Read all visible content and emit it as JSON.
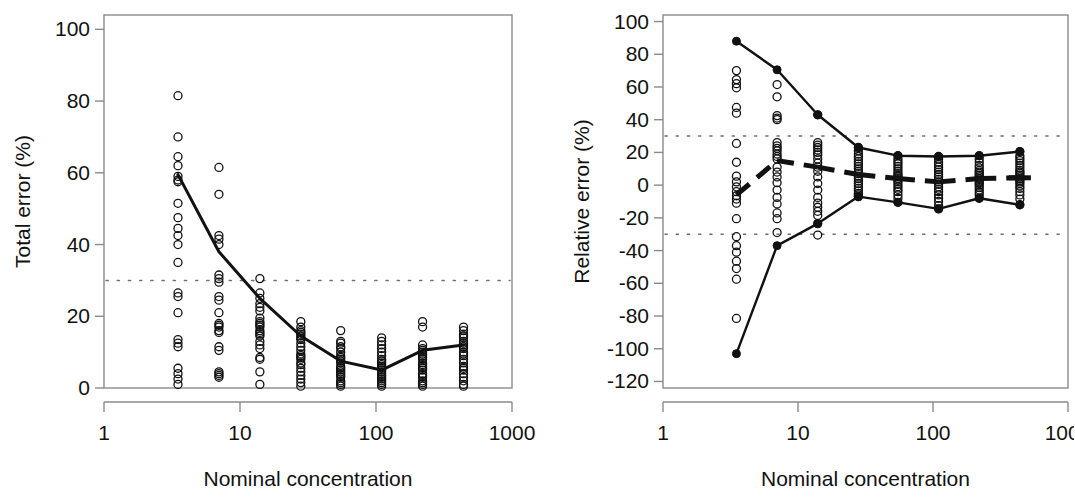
{
  "figure": {
    "background": "#ffffff",
    "ink": "#111111",
    "width": 1075,
    "height": 498
  },
  "chart_data": [
    {
      "panel": "left",
      "type": "scatter",
      "title": "",
      "xlabel": "Nominal concentration",
      "ylabel": "Total error (%)",
      "xscale": "log",
      "xlim": [
        1,
        1000
      ],
      "ylim": [
        0,
        104
      ],
      "grid": false,
      "legend": "none",
      "xtick_labels": [
        "1",
        "10",
        "100",
        "1000"
      ],
      "xtick_values": [
        1,
        10,
        100,
        1000
      ],
      "ytick_labels": [
        "0",
        "20",
        "40",
        "60",
        "80",
        "100"
      ],
      "ytick_values": [
        0,
        20,
        40,
        60,
        80,
        100
      ],
      "annotations": [
        {
          "name": "acceptance-threshold",
          "type": "hline",
          "value": 30,
          "style": "dotted",
          "label": "30"
        }
      ],
      "series": [
        {
          "name": "Median total error",
          "style": "solid-line",
          "x": [
            3.5,
            7,
            14,
            28,
            55,
            110,
            220,
            440
          ],
          "values": [
            59.5,
            38.0,
            25.0,
            14.5,
            7.5,
            5.0,
            10.5,
            12.0
          ]
        },
        {
          "name": "Total error observations",
          "style": "open-circles",
          "points": [
            {
              "x": 3.5,
              "y": [
                81.5,
                70.0,
                64.5,
                62.0,
                59.0,
                58.0,
                57.5,
                51.5,
                47.5,
                44.5,
                42.5,
                40.0,
                35.0,
                26.5,
                25.5,
                21.0,
                13.5,
                12.5,
                11.5,
                5.5,
                4.0,
                2.5,
                1.0
              ]
            },
            {
              "x": 7.0,
              "y": [
                61.5,
                54.0,
                42.5,
                41.5,
                40.0,
                31.5,
                30.5,
                29.5,
                25.5,
                24.5,
                21.0,
                18.0,
                17.5,
                17.0,
                16.0,
                15.5,
                11.5,
                10.5,
                4.5,
                4.0,
                3.5,
                3.0
              ]
            },
            {
              "x": 14.0,
              "y": [
                30.5,
                26.5,
                25.0,
                23.5,
                22.5,
                21.5,
                19.5,
                18.5,
                18.0,
                17.5,
                17.0,
                16.0,
                15.5,
                15.0,
                14.5,
                13.0,
                12.0,
                11.0,
                8.5,
                8.0,
                4.5,
                1.0
              ]
            },
            {
              "x": 28.0,
              "y": [
                18.5,
                17.0,
                16.0,
                15.5,
                15.0,
                14.5,
                14.0,
                13.5,
                12.5,
                11.5,
                10.5,
                9.5,
                9.0,
                8.5,
                8.0,
                7.0,
                6.5,
                5.5,
                4.5,
                3.5,
                2.5,
                1.5,
                0.5
              ]
            },
            {
              "x": 55.0,
              "y": [
                16.0,
                13.0,
                12.5,
                11.5,
                11.0,
                10.0,
                9.0,
                8.5,
                8.0,
                7.5,
                7.0,
                6.0,
                5.5,
                5.0,
                4.5,
                4.0,
                3.5,
                3.0,
                2.0,
                1.5,
                1.0,
                0.5
              ]
            },
            {
              "x": 110.0,
              "y": [
                14.0,
                13.0,
                12.0,
                11.0,
                10.0,
                9.0,
                8.0,
                7.5,
                7.0,
                6.5,
                6.0,
                5.5,
                5.0,
                4.5,
                4.0,
                3.5,
                3.0,
                2.5,
                2.0,
                1.5,
                1.0,
                0.5
              ]
            },
            {
              "x": 220.0,
              "y": [
                18.5,
                17.0,
                12.0,
                11.0,
                10.5,
                10.0,
                9.5,
                9.0,
                8.5,
                8.0,
                7.0,
                6.5,
                6.0,
                5.5,
                5.0,
                4.0,
                3.5,
                3.0,
                2.0,
                1.5,
                1.0,
                0.5
              ]
            },
            {
              "x": 440.0,
              "y": [
                17.0,
                16.0,
                15.0,
                14.5,
                14.0,
                13.0,
                12.5,
                12.0,
                11.5,
                11.0,
                10.0,
                9.5,
                9.0,
                8.0,
                7.0,
                6.0,
                5.5,
                5.0,
                4.0,
                3.0,
                2.0,
                1.0,
                0.5
              ]
            }
          ]
        }
      ]
    },
    {
      "panel": "right",
      "type": "scatter",
      "title": "",
      "xlabel": "Nominal concentration",
      "ylabel": "Relative error (%)",
      "xscale": "log",
      "xlim": [
        1,
        1000
      ],
      "ylim": [
        -124,
        104
      ],
      "grid": false,
      "legend": "none",
      "xtick_labels": [
        "1",
        "10",
        "100",
        "1000"
      ],
      "xtick_values": [
        1,
        10,
        100,
        1000
      ],
      "ytick_labels": [
        "-120",
        "-100",
        "-80",
        "-60",
        "-40",
        "-20",
        "0",
        "20",
        "40",
        "60",
        "80",
        "100"
      ],
      "ytick_values": [
        -120,
        -100,
        -80,
        -60,
        -40,
        -20,
        0,
        20,
        40,
        60,
        80,
        100
      ],
      "annotations": [
        {
          "name": "upper-acceptance-threshold",
          "type": "hline",
          "value": 30,
          "style": "dotted",
          "label": "30"
        },
        {
          "name": "lower-acceptance-threshold",
          "type": "hline",
          "value": -30,
          "style": "dotted",
          "label": "-30"
        }
      ],
      "series": [
        {
          "name": "Upper limit",
          "style": "solid-line-filled-markers",
          "x": [
            3.5,
            7,
            14,
            28,
            55,
            110,
            220,
            440
          ],
          "values": [
            88.0,
            70.5,
            43.0,
            23.0,
            18.0,
            17.5,
            18.0,
            20.5
          ]
        },
        {
          "name": "Lower limit",
          "style": "solid-line-filled-markers",
          "x": [
            3.5,
            7,
            14,
            28,
            55,
            110,
            220,
            440
          ],
          "values": [
            -103.0,
            -37.0,
            -23.5,
            -7.0,
            -10.5,
            -14.5,
            -8.0,
            -12.0
          ]
        },
        {
          "name": "Mean relative error",
          "style": "thick-dashed-line",
          "x": [
            3.5,
            7,
            14,
            28,
            55,
            110,
            220,
            440
          ],
          "values": [
            -6.0,
            15.0,
            11.0,
            6.5,
            4.0,
            2.0,
            4.0,
            4.5
          ]
        },
        {
          "name": "Relative error observations",
          "style": "open-circles",
          "points": [
            {
              "x": 3.5,
              "y": [
                70.0,
                64.5,
                62.0,
                59.5,
                47.5,
                44.0,
                25.5,
                14.0,
                5.5,
                2.0,
                -1.0,
                -4.0,
                -6.5,
                -8.5,
                -11.0,
                -20.5,
                -31.5,
                -37.0,
                -41.0,
                -46.5,
                -51.0,
                -57.5,
                -81.5
              ]
            },
            {
              "x": 7.0,
              "y": [
                61.5,
                54.0,
                42.5,
                41.0,
                40.0,
                26.0,
                24.0,
                22.5,
                21.0,
                19.0,
                17.5,
                16.0,
                11.0,
                8.0,
                5.0,
                1.5,
                -3.0,
                -7.5,
                -11.5,
                -17.0,
                -20.5,
                -29.0
              ]
            },
            {
              "x": 14.0,
              "y": [
                43.0,
                26.0,
                24.5,
                23.0,
                21.5,
                20.0,
                18.5,
                16.0,
                13.5,
                11.0,
                8.5,
                5.0,
                1.0,
                -3.0,
                -7.5,
                -11.0,
                -13.5,
                -16.0,
                -18.5,
                -23.5,
                -30.5
              ]
            },
            {
              "x": 28.0,
              "y": [
                23.0,
                21.0,
                19.0,
                17.5,
                16.0,
                14.5,
                13.0,
                11.5,
                10.0,
                8.5,
                7.0,
                5.5,
                4.0,
                2.5,
                1.0,
                -0.5,
                -2.0,
                -3.5,
                -5.0,
                -6.0,
                -7.0
              ]
            },
            {
              "x": 55.0,
              "y": [
                18.0,
                16.0,
                14.5,
                13.0,
                11.5,
                10.0,
                8.5,
                7.0,
                6.0,
                5.0,
                4.0,
                3.0,
                2.0,
                0.5,
                -1.0,
                -2.5,
                -4.0,
                -6.0,
                -8.0,
                -10.5
              ]
            },
            {
              "x": 110.0,
              "y": [
                17.5,
                16.0,
                14.0,
                12.5,
                11.0,
                9.5,
                8.0,
                6.5,
                5.0,
                3.5,
                2.0,
                0.5,
                -1.0,
                -2.5,
                -4.0,
                -6.0,
                -8.0,
                -10.0,
                -12.5,
                -14.5
              ]
            },
            {
              "x": 220.0,
              "y": [
                18.0,
                16.0,
                14.0,
                12.0,
                10.5,
                9.0,
                8.0,
                7.0,
                6.0,
                5.0,
                4.0,
                3.0,
                2.0,
                1.0,
                0.0,
                -1.5,
                -3.0,
                -4.5,
                -6.0,
                -8.0
              ]
            },
            {
              "x": 440.0,
              "y": [
                20.5,
                18.0,
                16.5,
                15.0,
                13.5,
                12.0,
                10.5,
                9.0,
                8.0,
                7.0,
                6.0,
                5.0,
                4.0,
                3.0,
                2.0,
                1.0,
                -0.5,
                -2.0,
                -4.0,
                -6.0,
                -8.5,
                -12.0
              ]
            }
          ]
        }
      ]
    }
  ]
}
